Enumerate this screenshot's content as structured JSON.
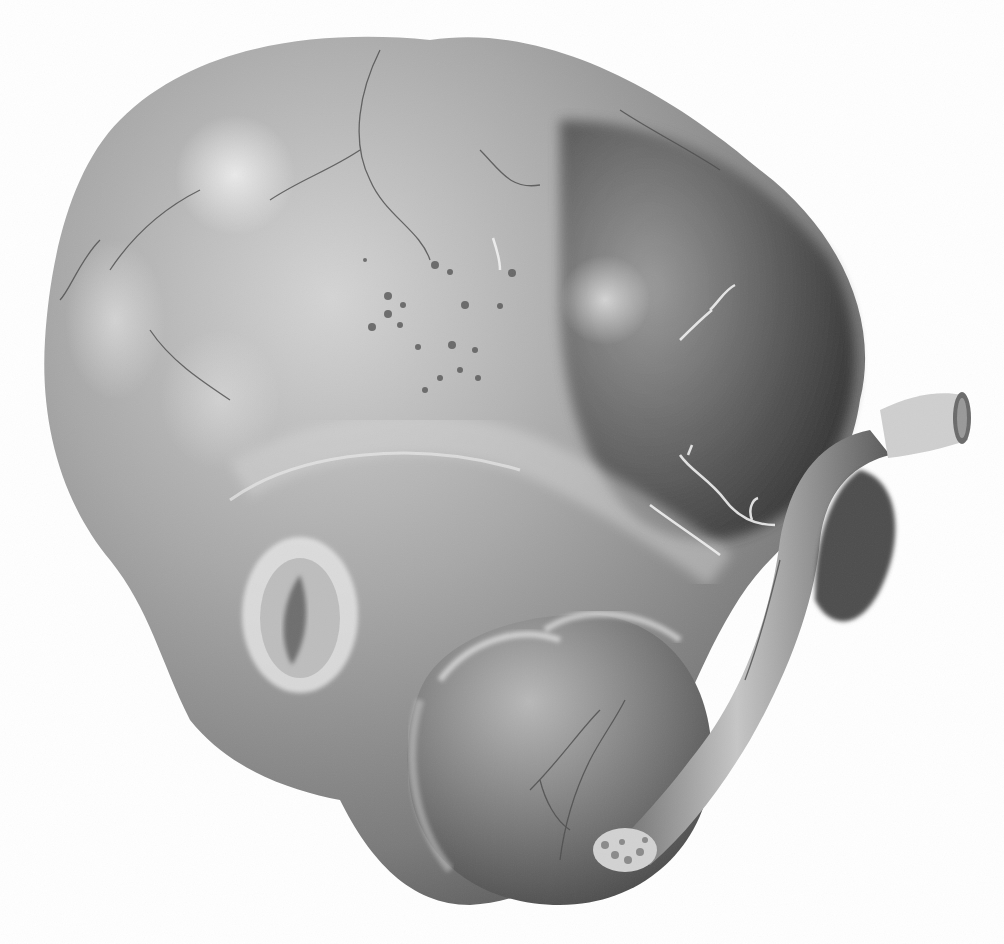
{
  "image": {
    "width": 1004,
    "height": 944,
    "style": "grayscale anatomical lithograph",
    "background": "#ffffff",
    "top_text_fragment": ""
  },
  "palette": {
    "mass_light": "#c9c9c9",
    "mass_mid": "#9d9d9d",
    "mass_dark": "#5f5f5f",
    "shadow": "#3e3e3e",
    "highlight": "#e2e2e2",
    "vessel_dark": "#4a4a4a",
    "vessel_light": "#f2f2f2",
    "speckle": "#555555"
  },
  "structures": [
    {
      "name": "main-lobed-mass",
      "description": "large rounded lobulated mass occupying most of the frame"
    },
    {
      "name": "lower-round-lobe",
      "description": "smaller round lobe at bottom center-right"
    },
    {
      "name": "ovoid-opening",
      "description": "pale ring with dark cleft, lower left"
    },
    {
      "name": "stalk",
      "description": "tubular stalk running diagonally down along right side"
    },
    {
      "name": "cut-stump-right",
      "description": "truncated cylindrical end at right edge"
    },
    {
      "name": "cut-stump-bottom",
      "description": "fringed cut end at lower right of round lobe"
    },
    {
      "name": "speckled-region",
      "description": "cluster of dark dots in upper center"
    },
    {
      "name": "surface-vessels",
      "description": "fine branching dark and pale vessels across surface"
    }
  ]
}
